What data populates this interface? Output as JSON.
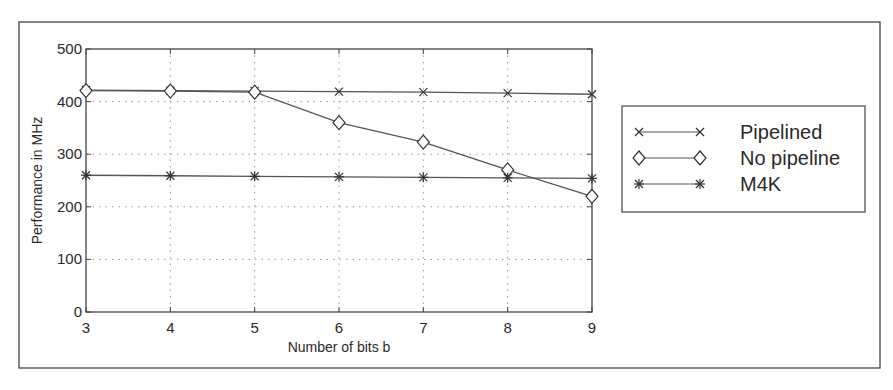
{
  "chart_data": {
    "type": "line",
    "title": "",
    "xlabel": "Number of bits b",
    "ylabel": "Performance in MHz",
    "x": [
      3,
      4,
      5,
      6,
      7,
      8,
      9
    ],
    "xlim": [
      3,
      9
    ],
    "ylim": [
      0,
      500
    ],
    "xticks": [
      3,
      4,
      5,
      6,
      7,
      8,
      9
    ],
    "yticks": [
      0,
      100,
      200,
      300,
      400,
      500
    ],
    "grid": true,
    "legend_position": "right, outside plot",
    "series": [
      {
        "name": "Pipelined",
        "marker": "x",
        "values": [
          422,
          421,
          420,
          419,
          418,
          416,
          414
        ]
      },
      {
        "name": "No pipeline",
        "marker": "diamond",
        "values": [
          421,
          420,
          418,
          360,
          323,
          270,
          220
        ]
      },
      {
        "name": "M4K",
        "marker": "asterisk",
        "values": [
          260,
          259,
          258,
          257,
          256,
          255,
          254
        ]
      }
    ]
  },
  "colors": {
    "line": "#555555",
    "frame": "#444444",
    "grid": "#9a9a9a",
    "background": "#ffffff"
  },
  "layout": {
    "frame": {
      "left": 19,
      "top": 22,
      "right": 880,
      "bottom": 368
    },
    "plot": {
      "left": 86,
      "top": 49,
      "right": 592,
      "bottom": 312
    },
    "legend": {
      "left": 622,
      "top": 106,
      "right": 865,
      "bottom": 212
    }
  }
}
